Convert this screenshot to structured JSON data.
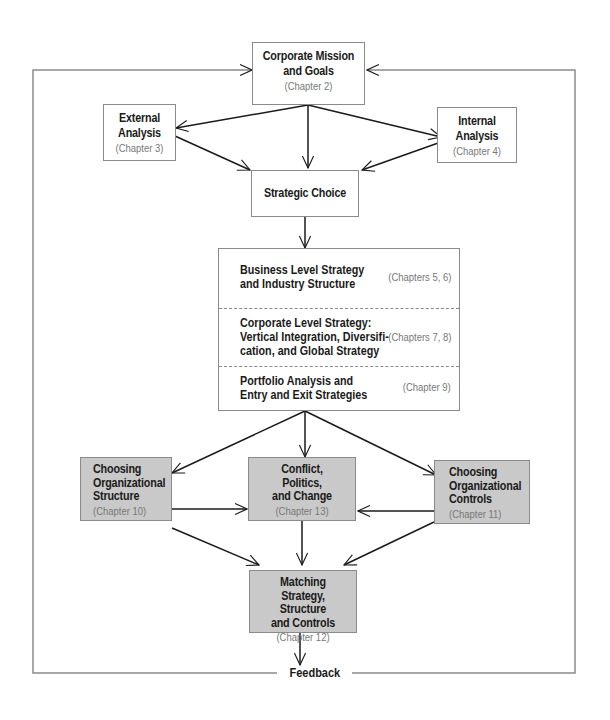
{
  "diagram": {
    "colors": {
      "line": "#1a1a1a",
      "frame": "#8a8a8a",
      "shaded_fill": "#c9c9c9",
      "chapter_text": "#777777"
    },
    "mission": {
      "title": "Corporate Mission\nand Goals",
      "chapter": "(Chapter 2)"
    },
    "external": {
      "title": "External\nAnalysis",
      "chapter": "(Chapter 3)"
    },
    "internal": {
      "title": "Internal\nAnalysis",
      "chapter": "(Chapter 4)"
    },
    "choice": {
      "title": "Strategic Choice"
    },
    "strategies": [
      {
        "title": "Business Level Strategy\nand Industry Structure",
        "chapter": "(Chapters 5, 6)"
      },
      {
        "title": "Corporate Level Strategy:\nVertical Integration, Diversifi-\ncation, and Global Strategy",
        "chapter": "(Chapters 7, 8)"
      },
      {
        "title": "Portfolio Analysis and\nEntry and Exit Strategies",
        "chapter": "(Chapter 9)"
      }
    ],
    "structure": {
      "title": "Choosing\nOrganizational\nStructure",
      "chapter": "(Chapter 10)"
    },
    "conflict": {
      "title": "Conflict,\nPolitics,\nand Change",
      "chapter": "(Chapter 13)"
    },
    "controls": {
      "title": "Choosing\nOrganizational\nControls",
      "chapter": "(Chapter 11)"
    },
    "matching": {
      "title": "Matching Strategy,\nStructure\nand Controls",
      "chapter": "(Chapter 12)"
    },
    "feedback_label": "Feedback"
  }
}
